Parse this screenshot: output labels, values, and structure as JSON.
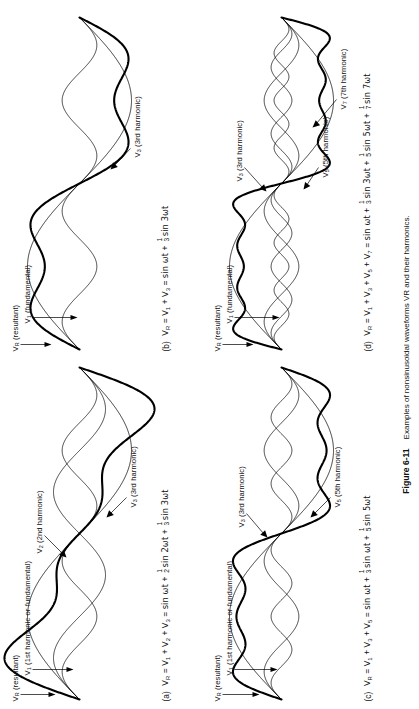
{
  "figure": {
    "caption_label": "Figure 6-11",
    "caption_text": "Examples of nonsinusoidal waveforms VR and their harmonics."
  },
  "panels": [
    {
      "id": "a",
      "key": "panel_a",
      "letter": "(a)",
      "equation_plain": "VR = V1 + V2 + V3 = sin ωt + 1/2 sin 2ωt + 1/3 sin 3ωt",
      "eq": {
        "lhs": "V",
        "lhs_sub": "R",
        "terms": [
          "V",
          "V",
          "V"
        ],
        "term_subs": [
          "1",
          "2",
          "3"
        ],
        "rhs_first": "sin ωt",
        "rhs": [
          {
            "num": "1",
            "den": "2",
            "body": "sin 2ωt"
          },
          {
            "num": "1",
            "den": "3",
            "body": "sin 3ωt"
          }
        ]
      },
      "annotations": [
        {
          "name": "resultant",
          "base": "V",
          "sub": "R",
          "tail": " (resultant)"
        },
        {
          "name": "fundamental",
          "base": "V",
          "sub": "1",
          "tail": " (1st harmonic or fundamental)"
        },
        {
          "name": "second-harmonic",
          "base": "V",
          "sub": "2",
          "tail": " (2nd harmonic)"
        },
        {
          "name": "third-harmonic",
          "base": "V",
          "sub": "3",
          "tail": " (3rd harmonic)"
        }
      ]
    },
    {
      "id": "b",
      "key": "panel_b",
      "letter": "(b)",
      "equation_plain": "VR = V1 + V3 = sin ωt + 1/3 sin 3ωt",
      "eq": {
        "lhs": "V",
        "lhs_sub": "R",
        "terms": [
          "V",
          "V"
        ],
        "term_subs": [
          "1",
          "3"
        ],
        "rhs_first": "sin ωt",
        "rhs": [
          {
            "num": "1",
            "den": "3",
            "body": "sin 3ωt"
          }
        ]
      },
      "annotations": [
        {
          "name": "resultant",
          "base": "V",
          "sub": "R",
          "tail": " (resultant)"
        },
        {
          "name": "fundamental",
          "base": "V",
          "sub": "1",
          "tail": " (fundamental)"
        },
        {
          "name": "third-harmonic",
          "base": "V",
          "sub": "3",
          "tail": " (3rd harmonic)"
        }
      ]
    },
    {
      "id": "c",
      "key": "panel_c",
      "letter": "(c)",
      "equation_plain": "VR = V1 + V3 + V5 = sin ωt + 1/3 sin ωt + 1/5 sin 5ωt",
      "eq": {
        "lhs": "V",
        "lhs_sub": "R",
        "terms": [
          "V",
          "V",
          "V"
        ],
        "term_subs": [
          "1",
          "3",
          "5"
        ],
        "rhs_first": "sin ωt",
        "rhs": [
          {
            "num": "1",
            "den": "3",
            "body": "sin ωt"
          },
          {
            "num": "1",
            "den": "5",
            "body": "sin 5ωt"
          }
        ]
      },
      "annotations": [
        {
          "name": "resultant",
          "base": "V",
          "sub": "R",
          "tail": " (resultant)"
        },
        {
          "name": "fundamental",
          "base": "V",
          "sub": "1",
          "tail": " (1st harmonic or fundamental)"
        },
        {
          "name": "third-harmonic",
          "base": "V",
          "sub": "3",
          "tail": " (3rd harmonic)"
        },
        {
          "name": "fifth-harmonic",
          "base": "V",
          "sub": "5",
          "tail": " (5th harmonic)"
        }
      ]
    },
    {
      "id": "d",
      "key": "panel_d",
      "letter": "(d)",
      "equation_plain": "VR = V1 + V3 + V5 + V7 = sin ωt + 1/3 sin 3ωt + 1/5 sin 5ωt + 1/7 sin 7ωt",
      "eq": {
        "lhs": "V",
        "lhs_sub": "R",
        "terms": [
          "V",
          "V",
          "V",
          "V"
        ],
        "term_subs": [
          "1",
          "3",
          "5",
          "7"
        ],
        "rhs_first": "sin ωt",
        "rhs": [
          {
            "num": "1",
            "den": "3",
            "body": "sin 3ωt"
          },
          {
            "num": "1",
            "den": "5",
            "body": "sin 5ωt"
          },
          {
            "num": "1",
            "den": "7",
            "body": "sin 7ωt"
          }
        ]
      },
      "annotations": [
        {
          "name": "resultant",
          "base": "V",
          "sub": "R",
          "tail": " (resultant)"
        },
        {
          "name": "fundamental",
          "base": "V",
          "sub": "1",
          "tail": " (fundamental)"
        },
        {
          "name": "third-harmonic",
          "base": "V",
          "sub": "3",
          "tail": " (3rd harmonic)"
        },
        {
          "name": "fifth-harmonic",
          "base": "V",
          "sub": "5",
          "tail": " (5th harmonic)"
        },
        {
          "name": "seventh-harmonic",
          "base": "V",
          "sub": "7",
          "tail": " (7th harmonic)"
        }
      ]
    }
  ],
  "chart_data": {
    "type": "line",
    "title": "Examples of nonsinusoidal waveforms VR and their harmonics.",
    "xlabel": "",
    "ylabel": "",
    "grid": false,
    "legend": "inline-annotations",
    "x_domain_cycles": 1,
    "plots": [
      {
        "panel": "a",
        "x": "0..2π (one cycle of ωt)",
        "series": [
          {
            "name": "V1 (1st harmonic or fundamental)",
            "harmonic": 1,
            "amplitude": 1.0,
            "expr": "sin ωt",
            "stroke": "thin"
          },
          {
            "name": "V2 (2nd harmonic)",
            "harmonic": 2,
            "amplitude": 0.5,
            "expr": "(1/2) sin 2ωt",
            "stroke": "thin"
          },
          {
            "name": "V3 (3rd harmonic)",
            "harmonic": 3,
            "amplitude": 0.3333,
            "expr": "(1/3) sin 3ωt",
            "stroke": "thin"
          },
          {
            "name": "VR (resultant)",
            "harmonic": 0,
            "amplitude": 1.45,
            "expr": "sin ωt + (1/2) sin 2ωt + (1/3) sin 3ωt",
            "stroke": "thick"
          }
        ]
      },
      {
        "panel": "b",
        "x": "0..2π (one cycle of ωt)",
        "series": [
          {
            "name": "V1 (fundamental)",
            "harmonic": 1,
            "amplitude": 1.0,
            "expr": "sin ωt",
            "stroke": "thin"
          },
          {
            "name": "V3 (3rd harmonic)",
            "harmonic": 3,
            "amplitude": 0.3333,
            "expr": "(1/3) sin 3ωt",
            "stroke": "thin"
          },
          {
            "name": "VR (resultant)",
            "harmonic": 0,
            "amplitude": 1.15,
            "expr": "sin ωt + (1/3) sin 3ωt",
            "stroke": "thick"
          }
        ]
      },
      {
        "panel": "c",
        "x": "0..2π (one cycle of ωt)",
        "series": [
          {
            "name": "V1 (1st harmonic or fundamental)",
            "harmonic": 1,
            "amplitude": 1.0,
            "expr": "sin ωt",
            "stroke": "thin"
          },
          {
            "name": "V3 (3rd harmonic)",
            "harmonic": 3,
            "amplitude": 0.3333,
            "expr": "(1/3) sin 3ωt",
            "stroke": "thin"
          },
          {
            "name": "V5 (5th harmonic)",
            "harmonic": 5,
            "amplitude": 0.2,
            "expr": "(1/5) sin 5ωt",
            "stroke": "thin"
          },
          {
            "name": "VR (resultant)",
            "harmonic": 0,
            "amplitude": 1.2,
            "expr": "sin ωt + (1/3) sin 3ωt + (1/5) sin 5ωt",
            "stroke": "thick"
          }
        ]
      },
      {
        "panel": "d",
        "x": "0..2π (one cycle of ωt)",
        "series": [
          {
            "name": "V1 (fundamental)",
            "harmonic": 1,
            "amplitude": 1.0,
            "expr": "sin ωt",
            "stroke": "thin"
          },
          {
            "name": "V3 (3rd harmonic)",
            "harmonic": 3,
            "amplitude": 0.3333,
            "expr": "(1/3) sin 3ωt",
            "stroke": "thin"
          },
          {
            "name": "V5 (5th harmonic)",
            "harmonic": 5,
            "amplitude": 0.2,
            "expr": "(1/5) sin 5ωt",
            "stroke": "thin"
          },
          {
            "name": "V7 (7th harmonic)",
            "harmonic": 7,
            "amplitude": 0.1429,
            "expr": "(1/7) sin 7ωt",
            "stroke": "thin"
          },
          {
            "name": "VR (resultant)",
            "harmonic": 0,
            "amplitude": 1.22,
            "expr": "sin ωt + (1/3) sin 3ωt + (1/5) sin 5ωt + (1/7) sin 7ωt",
            "stroke": "thick"
          }
        ]
      }
    ]
  }
}
